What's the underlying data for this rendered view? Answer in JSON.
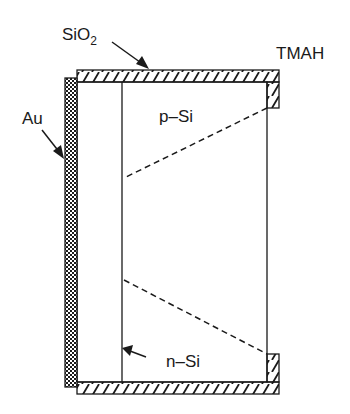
{
  "diagram": {
    "type": "cross-section",
    "labels": {
      "oxide": {
        "text": "SiO",
        "subscript": "2"
      },
      "etchant": "TMAH",
      "metal": "Au",
      "p_region": "p–Si",
      "n_region": "n–Si"
    },
    "materials": [
      {
        "name": "SiO2",
        "pattern": "diagonal-hatch",
        "role": "mask layer (top, bottom, right tabs)"
      },
      {
        "name": "Au",
        "pattern": "checkerboard",
        "role": "back contact (left)"
      },
      {
        "name": "p-Si",
        "pattern": "none",
        "role": "substrate"
      },
      {
        "name": "n-Si",
        "pattern": "none",
        "role": "junction layer"
      }
    ],
    "features": [
      {
        "name": "etch-front-upper",
        "style": "dashed"
      },
      {
        "name": "etch-front-lower",
        "style": "dashed"
      }
    ],
    "colors": {
      "ink": "#1a1a1a",
      "background": "#ffffff"
    }
  }
}
